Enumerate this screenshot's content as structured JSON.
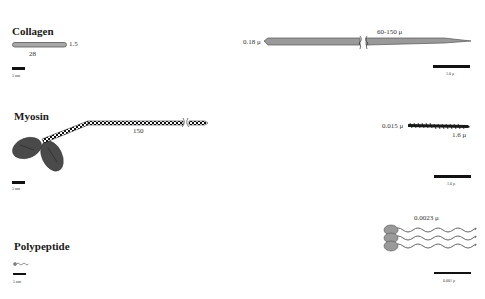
{
  "rows": [
    {
      "name": "Collagen",
      "molecule": {
        "length_label": "28",
        "width_label": "1.5",
        "scale_label": "5 nm"
      },
      "fiber": {
        "diameter_label": "0.18 μ",
        "length_label": "60-150 μ",
        "scale_label": "1.0 μ"
      }
    },
    {
      "name": "Myosin",
      "molecule": {
        "length_label": "150",
        "scale_label": "5 nm"
      },
      "fiber": {
        "diameter_label": "0.015 μ",
        "length_label": "1.6 μ",
        "scale_label": "1.0 μ"
      }
    },
    {
      "name": "Polypeptide",
      "molecule": {
        "scale_label": "5 nm"
      },
      "fiber": {
        "length_label": "0.0023 μ",
        "scale_label": "0.001 μ"
      }
    }
  ],
  "colors": {
    "fill_gray": "#8a8a8a",
    "dark_gray": "#4a4a4a",
    "scale_bar": "#111111"
  }
}
